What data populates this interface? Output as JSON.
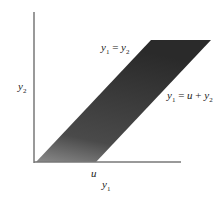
{
  "diagram": {
    "axes": {
      "x_label": "y",
      "x_label_sub": "1",
      "y_label": "y",
      "y_label_sub": "2",
      "x_tick_label": "u"
    },
    "region": {
      "shape": "parallelogram",
      "fill": "#2e2e2e",
      "edge_left_label": {
        "lhs": "y",
        "lhs_sub": "1",
        "eq": " = ",
        "rhs": "y",
        "rhs_sub": "2"
      },
      "edge_right_label": {
        "lhs": "y",
        "lhs_sub": "1",
        "eq": " = ",
        "rhs_u": "u",
        "plus": " + ",
        "rhs": "y",
        "rhs_sub": "2"
      }
    }
  }
}
